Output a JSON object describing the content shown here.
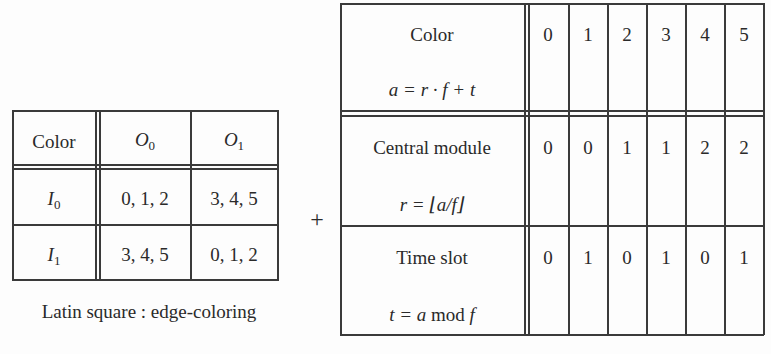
{
  "latin_square": {
    "header": [
      "Color",
      "O",
      "O"
    ],
    "header_subs": [
      "",
      "0",
      "1"
    ],
    "rows": [
      {
        "label": "I",
        "sub": "0",
        "cells": [
          "0, 1, 2",
          "3, 4, 5"
        ]
      },
      {
        "label": "I",
        "sub": "1",
        "cells": [
          "3, 4, 5",
          "0, 1, 2"
        ]
      }
    ],
    "caption": "Latin square : edge-coloring"
  },
  "plus_sign": "+",
  "mapping_table": {
    "rows": [
      {
        "title": "Color",
        "formula_var": "a",
        "formula_rest": "= r · f + t",
        "values": [
          "0",
          "1",
          "2",
          "3",
          "4",
          "5"
        ]
      },
      {
        "title": "Central module",
        "formula_var": "r",
        "formula_rest": "= ⌊a/f⌋",
        "values": [
          "0",
          "0",
          "1",
          "1",
          "2",
          "2"
        ]
      },
      {
        "title": "Time slot",
        "formula_var": "t",
        "formula_rest": "= a",
        "formula_mod": "mod",
        "formula_end": "f",
        "values": [
          "0",
          "1",
          "0",
          "1",
          "0",
          "1"
        ]
      }
    ]
  }
}
